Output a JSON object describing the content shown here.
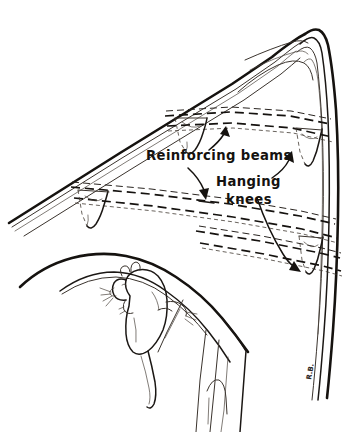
{
  "figure": {
    "domain": "hand-drawn technical illustration",
    "background_color": "#ffffff",
    "ink_color": "#15120f",
    "width": 346,
    "height": 432
  },
  "labels": {
    "reinforcing_beams": "Reinforcing beams",
    "hanging_knees_line1": "Hanging",
    "hanging_knees_line2": "knees"
  },
  "signature": {
    "initials": "R.B."
  },
  "parts": {
    "hull_sheer_label": "hull-sheer-line",
    "bow_stem_label": "bow-stem",
    "deck_curve_label": "lower-deck-curve",
    "frame_post_label": "vertical-frame-post",
    "animal_label": "rat",
    "beam_upper_label": "upper-reinforcing-beam",
    "beam_lower_label": "lower-reinforcing-beam",
    "beam_bottom_label": "bottom-reinforcing-beam",
    "knee_count": 4
  },
  "annotations": [
    {
      "id": "reinforcing-beams",
      "text": "Reinforcing beams",
      "targets": 2,
      "text_x": 146,
      "text_y": 160
    },
    {
      "id": "hanging-knees",
      "text": "Hanging knees",
      "targets": 2,
      "text_x": 216,
      "text_y": 186
    }
  ]
}
